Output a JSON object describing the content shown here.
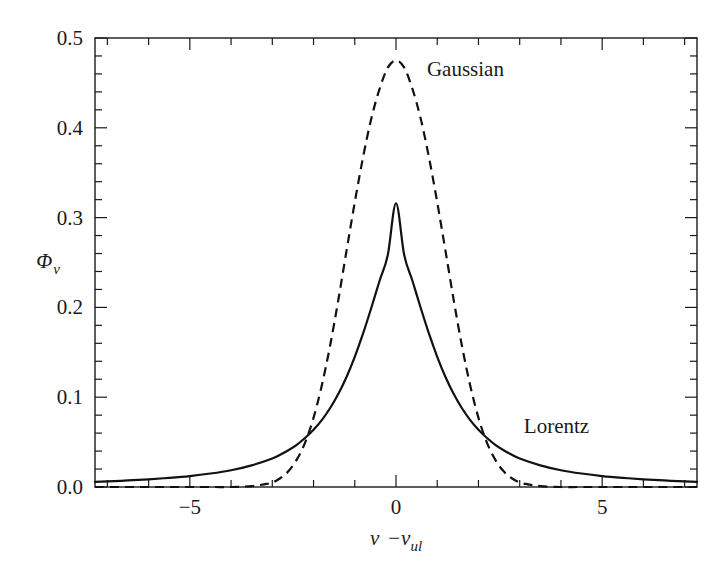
{
  "figure": {
    "background_color": "#ffffff",
    "ink_color": "#1a1a1a",
    "width": 727,
    "height": 580
  },
  "axes": {
    "frame": {
      "left": 95,
      "top": 38,
      "right": 697,
      "bottom": 487
    },
    "x": {
      "label_main": "ν",
      "label_minus": "−",
      "label_nu2": "ν",
      "label_sub": "ul",
      "label_full": "ν − ν_ul",
      "range": [
        -7.3,
        7.3
      ],
      "major_ticks": [
        -5,
        0,
        5
      ],
      "major_tick_labels": [
        "−5",
        "0",
        "5"
      ],
      "minor_tick_step": 1,
      "tick_direction": "in"
    },
    "y": {
      "label_main": "Φ",
      "label_sub": "ν",
      "label_full": "Φ_ν",
      "range": [
        0.0,
        0.5
      ],
      "major_ticks": [
        0.0,
        0.1,
        0.2,
        0.3,
        0.4,
        0.5
      ],
      "major_tick_labels": [
        "0.0",
        "0.1",
        "0.2",
        "0.3",
        "0.4",
        "0.5"
      ],
      "minor_tick_step": 0.02,
      "tick_direction": "in"
    }
  },
  "annotations": [
    {
      "name": "gaussian-label",
      "text": "Gaussian",
      "x_data": 0.75,
      "y_data": 0.458
    },
    {
      "name": "lorentz-label",
      "text": "Lorentz",
      "x_data": 3.1,
      "y_data": 0.06
    }
  ],
  "chart_data": {
    "type": "line",
    "title": "",
    "xlabel": "ν − ν_ul",
    "ylabel": "Φ_ν",
    "xlim": [
      -7.3,
      7.3
    ],
    "ylim": [
      0.0,
      0.5
    ],
    "grid": false,
    "legend_position": "inline-annotations",
    "series": [
      {
        "name": "Gaussian",
        "style": "dashed",
        "color": "#111111",
        "line_width": 2.2,
        "peak_value": 0.475,
        "peak_x": 0.0,
        "sigma": 0.84,
        "fwhm": 1.98,
        "x": [
          -7.3,
          -7.0,
          -6.5,
          -6.0,
          -5.5,
          -5.0,
          -4.5,
          -4.0,
          -3.5,
          -3.2,
          -3.0,
          -2.8,
          -2.6,
          -2.4,
          -2.2,
          -2.0,
          -1.8,
          -1.6,
          -1.4,
          -1.2,
          -1.0,
          -0.8,
          -0.6,
          -0.4,
          -0.2,
          0.0,
          0.2,
          0.4,
          0.6,
          0.8,
          1.0,
          1.2,
          1.4,
          1.6,
          1.8,
          2.0,
          2.2,
          2.4,
          2.6,
          2.8,
          3.0,
          3.2,
          3.5,
          4.0,
          4.5,
          5.0,
          5.5,
          6.0,
          6.5,
          7.0,
          7.3
        ],
        "y": [
          0.0,
          0.0,
          0.0,
          0.0,
          0.0,
          0.0,
          0.0,
          0.0,
          0.001,
          0.003,
          0.005,
          0.01,
          0.018,
          0.031,
          0.05,
          0.077,
          0.113,
          0.157,
          0.208,
          0.263,
          0.317,
          0.367,
          0.41,
          0.443,
          0.467,
          0.475,
          0.467,
          0.443,
          0.41,
          0.367,
          0.317,
          0.263,
          0.208,
          0.157,
          0.113,
          0.077,
          0.05,
          0.031,
          0.018,
          0.01,
          0.005,
          0.003,
          0.001,
          0.0,
          0.0,
          0.0,
          0.0,
          0.0,
          0.0,
          0.0,
          0.0
        ]
      },
      {
        "name": "Lorentz",
        "style": "solid",
        "color": "#111111",
        "line_width": 2.2,
        "peak_value": 0.316,
        "peak_x": 0.0,
        "gamma": 1.005,
        "fwhm": 2.01,
        "x": [
          -7.3,
          -7.0,
          -6.5,
          -6.0,
          -5.5,
          -5.0,
          -4.5,
          -4.0,
          -3.5,
          -3.0,
          -2.8,
          -2.6,
          -2.4,
          -2.2,
          -2.0,
          -1.8,
          -1.6,
          -1.4,
          -1.2,
          -1.0,
          -0.8,
          -0.6,
          -0.4,
          -0.2,
          0.0,
          0.2,
          0.4,
          0.6,
          0.8,
          1.0,
          1.2,
          1.4,
          1.6,
          1.8,
          2.0,
          2.2,
          2.4,
          2.6,
          2.8,
          3.0,
          3.5,
          4.0,
          4.5,
          5.0,
          5.5,
          6.0,
          6.5,
          7.0,
          7.3
        ],
        "y": [
          0.0058,
          0.0063,
          0.0073,
          0.0086,
          0.0102,
          0.0122,
          0.015,
          0.0187,
          0.0241,
          0.0318,
          0.0361,
          0.0412,
          0.0473,
          0.0548,
          0.0637,
          0.0745,
          0.0877,
          0.1035,
          0.1225,
          0.145,
          0.1707,
          0.1993,
          0.2294,
          0.2581,
          0.316,
          0.2581,
          0.2294,
          0.1993,
          0.1707,
          0.145,
          0.1225,
          0.1035,
          0.0877,
          0.0745,
          0.0637,
          0.0548,
          0.0473,
          0.0412,
          0.0361,
          0.0318,
          0.0241,
          0.0187,
          0.015,
          0.0122,
          0.0102,
          0.0086,
          0.0073,
          0.0063,
          0.0058
        ]
      }
    ]
  }
}
